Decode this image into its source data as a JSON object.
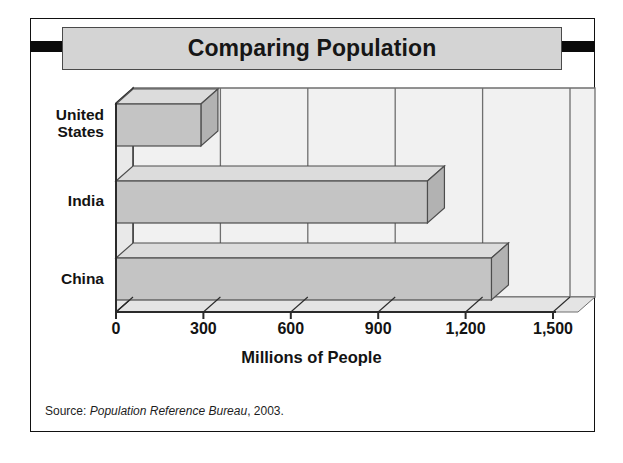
{
  "figure": {
    "title": "Comparing Population",
    "source_prefix": "Source: ",
    "source_italic": "Population Reference Bureau",
    "source_suffix": ", 2003.",
    "frame_color": "#111111",
    "banner_color": "#d4d4d4",
    "tab_color": "#0a0a0a"
  },
  "chart_data": {
    "type": "bar",
    "orientation": "horizontal",
    "title": "Comparing Population",
    "categories": [
      "United States",
      "India",
      "China"
    ],
    "category_label_lines": [
      [
        "United",
        "States"
      ],
      [
        "India"
      ],
      [
        "China"
      ]
    ],
    "values": [
      291.5,
      1069,
      1288.7
    ],
    "value_labels": [
      "291.5",
      "1,069",
      "1,288.7"
    ],
    "xlabel": "Millions of People",
    "ylabel": "",
    "xlim": [
      0,
      1500
    ],
    "xticks": [
      0,
      300,
      600,
      900,
      1200,
      1500
    ],
    "xtick_labels": [
      "0",
      "300",
      "600",
      "900",
      "1,200",
      "1,500"
    ],
    "grid": true,
    "grid_axis": "x",
    "legend": false,
    "style": "3d-bar",
    "bar_front_color": "#c4c4c4",
    "bar_top_color": "#dcdcdc",
    "bar_side_color": "#b2b2b2",
    "bar_edge_color": "#4d4d4d",
    "plot_bg_color": "#f1f1f1",
    "wall_color": "#e9e9e9",
    "gridline_color": "#6f6f6f",
    "axis_color": "#2a2a2a",
    "source": "Population Reference Bureau, 2003."
  }
}
